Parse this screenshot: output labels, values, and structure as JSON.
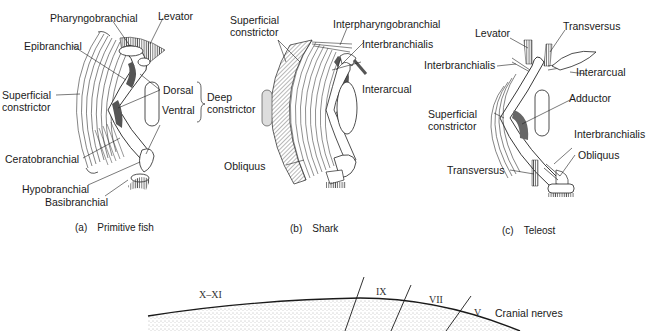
{
  "figure": {
    "panels": [
      {
        "id": "a",
        "caption_letter": "(a)",
        "caption_text": "Primitive fish",
        "labels": {
          "pharyngobranchial": "Pharyngobranchial",
          "levator": "Levator",
          "epibranchial": "Epibranchial",
          "superficial_constrictor_1": "Superficial",
          "superficial_constrictor_2": "constrictor",
          "dorsal": "Dorsal",
          "deep_constrictor_1": "Deep",
          "deep_constrictor_2": "constrictor",
          "ventral": "Ventral",
          "ceratobranchial": "Ceratobranchial",
          "hypobranchial": "Hypobranchial",
          "basibranchial": "Basibranchial"
        }
      },
      {
        "id": "b",
        "caption_letter": "(b)",
        "caption_text": "Shark",
        "labels": {
          "superficial_constrictor_1": "Superficial",
          "superficial_constrictor_2": "constrictor",
          "interpharyngobranchial": "Interpharyngobranchial",
          "interbranchialis": "Interbranchialis",
          "interarcual": "Interarcual",
          "obliquus": "Obliquus"
        }
      },
      {
        "id": "c",
        "caption_letter": "(c)",
        "caption_text": "Teleost",
        "labels": {
          "levator": "Levator",
          "transversus_top": "Transversus",
          "interbranchialis_top": "Interbranchialis",
          "interarcual": "Interarcual",
          "adductor": "Adductor",
          "superficial_constrictor_1": "Superficial",
          "superficial_constrictor_2": "constrictor",
          "interbranchialis_bottom": "Interbranchialis",
          "obliquus": "Obliquus",
          "transversus_bottom": "Transversus"
        }
      }
    ],
    "cranial_nerves": {
      "title": "Cranial nerves",
      "numerals": [
        "X–XI",
        "IX",
        "VII",
        "V"
      ]
    }
  }
}
